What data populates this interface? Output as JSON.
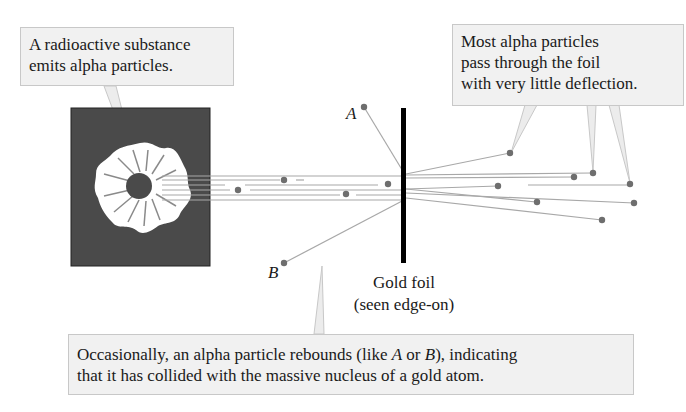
{
  "diagram": {
    "callouts": {
      "source": "A radioactive substance emits alpha particles.",
      "pass_through": {
        "line1": "Most alpha particles",
        "line2": "pass through the foil",
        "line3": "with very little deflection."
      },
      "rebound": {
        "line1_pre": "Occasionally, an alpha particle rebounds (like ",
        "line1_a": "A",
        "line1_mid": " or ",
        "line1_b": "B",
        "line1_post": "), indicating",
        "line2": "that it has collided with the massive nucleus of a gold atom."
      }
    },
    "labels": {
      "particle_a": "A",
      "particle_b": "B",
      "foil_line1": "Gold foil",
      "foil_line2": "(seen edge-on)"
    },
    "colors": {
      "source_box": "#4a4a4a",
      "emitter": "#ffffff",
      "particle": "#6e6e6e",
      "track": "#a8a8a8",
      "foil": "#000000",
      "callout_fill": "#f1f1f1",
      "callout_border": "#c8c8c8"
    },
    "components": [
      "radioactive source",
      "alpha particle beam",
      "gold foil",
      "deflected particles",
      "rebounded particles A and B"
    ]
  }
}
